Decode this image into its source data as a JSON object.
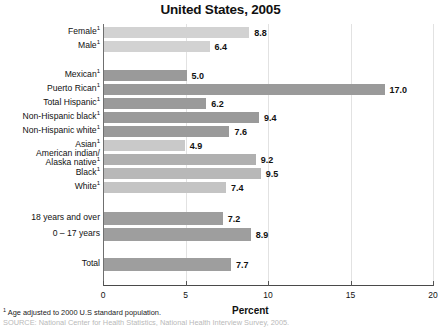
{
  "chart_data": {
    "type": "bar",
    "orientation": "horizontal",
    "title": "United States, 2005",
    "xlabel": "Percent",
    "ylabel": "",
    "xlim": [
      0,
      20
    ],
    "xticks": [
      0,
      5,
      10,
      15,
      20
    ],
    "xtick_labels": [
      "0",
      "5",
      "10",
      "15",
      "20"
    ],
    "grid": false,
    "legend": "none",
    "categories": [
      "Female ¹",
      "Male ¹",
      "Mexican ¹",
      "Puerto Rican ¹",
      "Total Hispanic ¹",
      "Non-Hispanic black ¹",
      "Non-Hispanic white ¹",
      "Asian ¹",
      "American indian/ Alaska native ¹",
      "Black ¹",
      "White ¹",
      "18 years and over",
      "0 – 17 years",
      "Total"
    ],
    "values": [
      8.8,
      6.4,
      5.0,
      17.0,
      6.2,
      9.4,
      7.6,
      4.9,
      9.2,
      9.5,
      7.4,
      7.2,
      8.9,
      7.7
    ],
    "value_labels": [
      "8.8",
      "6.4",
      "5.0",
      "17.0",
      "6.2",
      "9.4",
      "7.6",
      "4.9",
      "9.2",
      "9.5",
      "7.4",
      "7.2",
      "8.9",
      "7.7"
    ],
    "bar_colors": [
      "#d2d2d2",
      "#d2d2d2",
      "#9a9a9a",
      "#9a9a9a",
      "#9a9a9a",
      "#9a9a9a",
      "#9a9a9a",
      "#c9c9c9",
      "#b0b0b0",
      "#b8b8b8",
      "#c4c4c4",
      "#9e9e9e",
      "#9e9e9e",
      "#9e9e9e"
    ],
    "annotations": [
      "¹ Age adjusted to 2000 U.S standard population."
    ]
  },
  "bars": [
    {
      "label": "Female",
      "sup": "1",
      "value": "8.8",
      "num": 8.8,
      "color": "#d2d2d2",
      "top": 3,
      "height": 11,
      "label_top": 3,
      "label_lines": 1
    },
    {
      "label": "Male",
      "sup": "1",
      "value": "6.4",
      "num": 6.4,
      "color": "#d2d2d2",
      "top": 17,
      "height": 11,
      "label_top": 17,
      "label_lines": 1
    },
    {
      "label": "Mexican",
      "sup": "1",
      "value": "5.0",
      "num": 5.0,
      "color": "#9a9a9a",
      "top": 46,
      "height": 11,
      "label_top": 46,
      "label_lines": 1
    },
    {
      "label": "Puerto Rican",
      "sup": "1",
      "value": "17.0",
      "num": 17.0,
      "color": "#9a9a9a",
      "top": 60,
      "height": 11,
      "label_top": 60,
      "label_lines": 1
    },
    {
      "label": "Total Hispanic",
      "sup": "1",
      "value": "6.2",
      "num": 6.2,
      "color": "#9a9a9a",
      "top": 74,
      "height": 11,
      "label_top": 74,
      "label_lines": 1
    },
    {
      "label": "Non-Hispanic black",
      "sup": "1",
      "value": "9.4",
      "num": 9.4,
      "color": "#9a9a9a",
      "top": 88,
      "height": 11,
      "label_top": 88,
      "label_lines": 1
    },
    {
      "label": "Non-Hispanic white",
      "sup": "1",
      "value": "7.6",
      "num": 7.6,
      "color": "#9a9a9a",
      "top": 102,
      "height": 11,
      "label_top": 102,
      "label_lines": 1
    },
    {
      "label": "Asian",
      "sup": "1",
      "value": "4.9",
      "num": 4.9,
      "color": "#c9c9c9",
      "top": 116,
      "height": 11,
      "label_top": 116,
      "label_lines": 1
    },
    {
      "label": "American indian/",
      "label2": "Alaska native",
      "sup": "1",
      "value": "9.2",
      "num": 9.2,
      "color": "#b0b0b0",
      "top": 130,
      "height": 11,
      "label_top": 125,
      "label_lines": 2
    },
    {
      "label": "Black",
      "sup": "1",
      "value": "9.5",
      "num": 9.5,
      "color": "#b8b8b8",
      "top": 144,
      "height": 11,
      "label_top": 144,
      "label_lines": 1
    },
    {
      "label": "White",
      "sup": "1",
      "value": "7.4",
      "num": 7.4,
      "color": "#c4c4c4",
      "top": 158,
      "height": 11,
      "label_top": 158,
      "label_lines": 1
    },
    {
      "label": "18 years and over",
      "sup": "",
      "value": "7.2",
      "num": 7.2,
      "color": "#9e9e9e",
      "top": 188,
      "height": 13,
      "label_top": 189,
      "label_lines": 1
    },
    {
      "label": "0 – 17 years",
      "sup": "",
      "value": "8.9",
      "num": 8.9,
      "color": "#9e9e9e",
      "top": 204,
      "height": 13,
      "label_top": 205,
      "label_lines": 1
    },
    {
      "label": "Total",
      "sup": "",
      "value": "7.7",
      "num": 7.7,
      "color": "#9e9e9e",
      "top": 234,
      "height": 13,
      "label_top": 235,
      "label_lines": 1
    }
  ],
  "footnotes": {
    "line1_sup": "1",
    "line1": " Age adjusted to 2000 U.S standard population.",
    "line2": "SOURCE: National Center for Health Statistics, National Health Interview Survey, 2005."
  }
}
